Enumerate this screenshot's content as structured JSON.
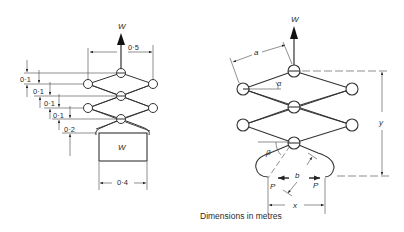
{
  "figure": {
    "caption": "Dimensions in metres",
    "left_diagram": {
      "load_top": "W",
      "load_box": "W",
      "width_top": "0·5",
      "width_box": "0·4",
      "vertical_dims": [
        "0·1",
        "0·1",
        "0·1",
        "0·1",
        "0·2"
      ]
    },
    "right_diagram": {
      "load_top": "W",
      "link_length": "a",
      "angle_link": "α",
      "angle_hook": "β",
      "hook_length": "b",
      "force_left": "P",
      "force_right": "P",
      "height": "y",
      "span": "x"
    }
  }
}
